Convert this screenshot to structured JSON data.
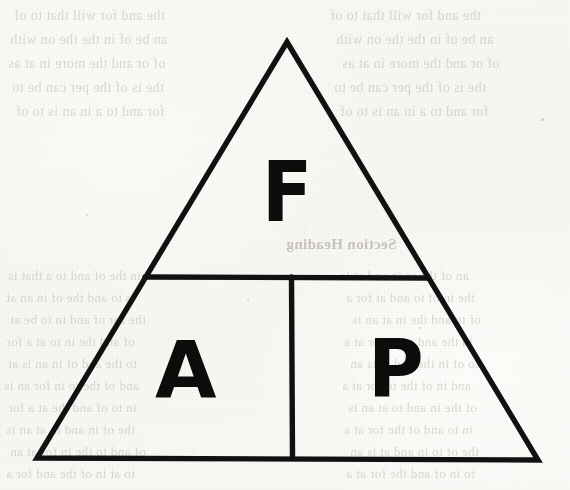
{
  "page": {
    "kind": "scanned-book-page",
    "width": 570,
    "height": 490,
    "paper_color": "#f8f7f4",
    "ink_color": "#0d0c0b"
  },
  "diagram": {
    "name": "fire-triangle",
    "shape": "triangle",
    "stroke_color": "#111111",
    "stroke_width": 5,
    "apex": {
      "x": 287,
      "y": 42
    },
    "bottom_left": {
      "x": 37,
      "y": 458
    },
    "bottom_right": {
      "x": 538,
      "y": 460
    },
    "horizontal_divider": {
      "x1": 145,
      "y1": 277,
      "x2": 428,
      "y2": 278
    },
    "vertical_divider": {
      "x1": 291,
      "y1": 277,
      "x2": 292,
      "y2": 458
    },
    "regions": [
      {
        "id": "top",
        "label": "F"
      },
      {
        "id": "bottom-left",
        "label": "A"
      },
      {
        "id": "bottom-right",
        "label": "P"
      }
    ]
  },
  "labels": {
    "top": "F",
    "bottom_left": "A",
    "bottom_right": "P"
  },
  "background_text": {
    "note": "faint mirror-reversed bleed-through from the reverse side of the page; not legible",
    "lines": [
      {
        "text": "the and for will that to of",
        "x": 14,
        "y": 8,
        "size": 14
      },
      {
        "text": "an be of in the the on with",
        "x": 10,
        "y": 32,
        "size": 14
      },
      {
        "text": "of or and the more in at as",
        "x": 8,
        "y": 56,
        "size": 14
      },
      {
        "text": "the is of the per can be to",
        "x": 12,
        "y": 80,
        "size": 14
      },
      {
        "text": "for and to a in an is to of",
        "x": 16,
        "y": 104,
        "size": 14
      }
    ],
    "heading": {
      "text": "Section Heading",
      "x": 286,
      "y": 236,
      "size": 15
    },
    "lower_lines": [
      {
        "text": "in the of and to a that is",
        "x": 8,
        "y": 268,
        "size": 13
      },
      {
        "text": "is to and the of in an at",
        "x": 6,
        "y": 290,
        "size": 13
      },
      {
        "text": "the for of and in to be at",
        "x": 10,
        "y": 312,
        "size": 13
      },
      {
        "text": "of and the in to at a for",
        "x": 6,
        "y": 334,
        "size": 13
      },
      {
        "text": "to the and of in an is at",
        "x": 8,
        "y": 356,
        "size": 13
      },
      {
        "text": "and of the to in for an is",
        "x": 4,
        "y": 378,
        "size": 13
      },
      {
        "text": "in to of and the at a for",
        "x": 8,
        "y": 400,
        "size": 13
      },
      {
        "text": "the of in and to at an is",
        "x": 6,
        "y": 422,
        "size": 13
      },
      {
        "text": "of and to the in for at an",
        "x": 10,
        "y": 444,
        "size": 13
      },
      {
        "text": "to at in of the and for a",
        "x": 6,
        "y": 466,
        "size": 13
      }
    ],
    "right_lines": [
      {
        "text": "an of the to in and at is",
        "x": 340,
        "y": 268,
        "size": 13
      },
      {
        "text": "the in of to and at for a",
        "x": 346,
        "y": 290,
        "size": 13
      },
      {
        "text": "of to and the in at an is",
        "x": 352,
        "y": 312,
        "size": 13
      },
      {
        "text": "in the and of to for at a",
        "x": 344,
        "y": 334,
        "size": 13
      },
      {
        "text": "to of in the and at is an",
        "x": 350,
        "y": 356,
        "size": 13
      },
      {
        "text": "and in of the to for at a",
        "x": 342,
        "y": 378,
        "size": 13
      },
      {
        "text": "of the in and to at an is",
        "x": 348,
        "y": 400,
        "size": 13
      },
      {
        "text": "in to and of the for at a",
        "x": 344,
        "y": 422,
        "size": 13
      },
      {
        "text": "the of to in and at is an",
        "x": 350,
        "y": 444,
        "size": 13
      },
      {
        "text": "to in of and the for at a",
        "x": 346,
        "y": 466,
        "size": 13
      }
    ]
  }
}
